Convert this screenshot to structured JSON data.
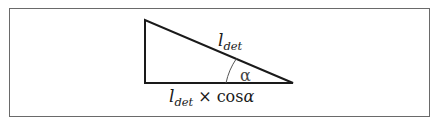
{
  "diagram": {
    "type": "right-triangle",
    "frame": {
      "border_color": "#6a6a6a"
    },
    "stroke_color": "#1a1a1a",
    "vertices": {
      "top_left": [
        145,
        20
      ],
      "bottom_left": [
        145,
        83
      ],
      "right": [
        293,
        83
      ]
    },
    "hypotenuse_label": {
      "base": "l",
      "subscript": "det"
    },
    "angle_label": {
      "symbol": "α"
    },
    "base_label": {
      "base": "l",
      "subscript": "det",
      "operator": "×",
      "function": "cos",
      "argument": "α"
    }
  }
}
